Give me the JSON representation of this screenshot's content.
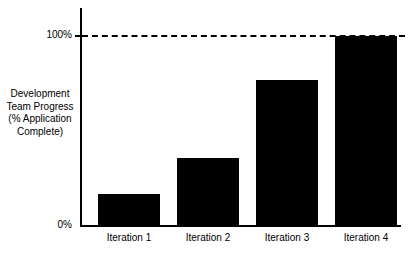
{
  "chart_data": {
    "type": "bar",
    "title": "",
    "xlabel": "",
    "ylabel": "Development Team Progress (% Application Complete)",
    "categories": [
      "Iteration 1",
      "Iteration 2",
      "Iteration 3",
      "Iteration 4"
    ],
    "values": [
      17,
      36,
      77,
      100
    ],
    "ylim": [
      0,
      100
    ],
    "ytick_labels": [
      "0%",
      "100%"
    ],
    "ytick_values": [
      0,
      100
    ],
    "grid": false,
    "legend": null,
    "bar_color": "#000000",
    "axis_color": "#000000",
    "background_color": "#ffffff",
    "reference_line": {
      "value": 100,
      "style": "dashed",
      "color": "#000000"
    }
  },
  "axis": {
    "y_title_lines": [
      "Development",
      "Team Progress",
      "(% Application",
      "Complete)"
    ],
    "y_tick_top": "100%",
    "y_tick_bottom": "0%"
  },
  "categories": {
    "item0": "Iteration 1",
    "item1": "Iteration 2",
    "item2": "Iteration 3",
    "item3": "Iteration 4"
  }
}
